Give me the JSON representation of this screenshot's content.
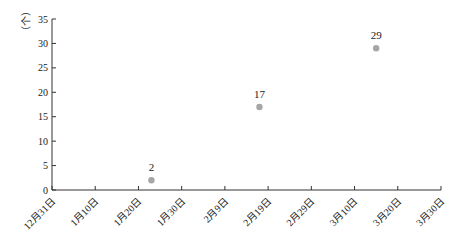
{
  "chart_data": {
    "type": "scatter",
    "title": "",
    "xlabel": "",
    "ylabel": "（个）",
    "ylim": [
      0,
      35
    ],
    "yticks": [
      0,
      5,
      10,
      15,
      20,
      25,
      30,
      35
    ],
    "xticks": [
      "12月31日",
      "1月10日",
      "1月20日",
      "1月30日",
      "2月9日",
      "2月19日",
      "2月29日",
      "3月10日",
      "3月20日",
      "3月30日"
    ],
    "grid": false,
    "legend": null,
    "marker_color": "#a6a6a6",
    "series": [
      {
        "name": "",
        "points": [
          {
            "x": "1月23日",
            "x_day_offset": 23,
            "y": 2,
            "label": "2"
          },
          {
            "x": "2月17日",
            "x_day_offset": 48,
            "y": 17,
            "label": "17"
          },
          {
            "x": "3月15日",
            "x_day_offset": 75,
            "y": 29,
            "label": "29"
          }
        ]
      }
    ]
  }
}
